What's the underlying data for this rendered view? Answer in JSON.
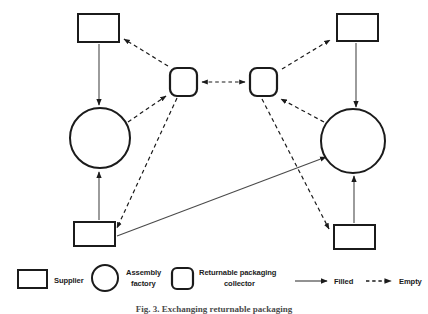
{
  "figure": {
    "caption": "Fig. 3.  Exchanging returnable packaging",
    "caption_visible_fragment": "Fig. 3.  Exchanging returnable packaging"
  },
  "colors": {
    "stroke": "#1b1b1b",
    "fill": "#ffffff",
    "background": "#ffffff",
    "caption": "#4a4a4a"
  },
  "diagram": {
    "nodes": [
      {
        "id": "supplier-top-left",
        "type": "supplier",
        "shape": "rectangle",
        "x": 78,
        "y": 14,
        "w": 41,
        "h": 28
      },
      {
        "id": "factory-left",
        "type": "assembly-factory",
        "shape": "circle",
        "cx": 100,
        "cy": 138,
        "r": 30
      },
      {
        "id": "supplier-bottom-left",
        "type": "supplier",
        "shape": "rectangle",
        "x": 74,
        "y": 222,
        "w": 41,
        "h": 24
      },
      {
        "id": "collector-left",
        "type": "returnable-packaging-collector",
        "shape": "rounded-square",
        "x": 170,
        "y": 68,
        "w": 27,
        "h": 28
      },
      {
        "id": "collector-right",
        "type": "returnable-packaging-collector",
        "shape": "rounded-square",
        "x": 250,
        "y": 68,
        "w": 27,
        "h": 28
      },
      {
        "id": "supplier-top-right",
        "type": "supplier",
        "shape": "rectangle",
        "x": 337,
        "y": 14,
        "w": 41,
        "h": 27
      },
      {
        "id": "factory-right",
        "type": "assembly-factory",
        "shape": "circle",
        "cx": 353,
        "cy": 141,
        "r": 32
      },
      {
        "id": "supplier-bottom-right",
        "type": "supplier",
        "shape": "rectangle",
        "x": 334,
        "y": 225,
        "w": 41,
        "h": 24
      }
    ],
    "edges": [
      {
        "id": "edge-supplier-tl-to-factory-l",
        "from": "supplier-top-left",
        "to": "factory-left",
        "style": "filled"
      },
      {
        "id": "edge-supplier-bl-to-factory-l",
        "from": "supplier-bottom-left",
        "to": "factory-left",
        "style": "filled"
      },
      {
        "id": "edge-supplier-bl-to-factory-r",
        "from": "supplier-bottom-left",
        "to": "factory-right",
        "style": "filled"
      },
      {
        "id": "edge-supplier-tr-to-factory-r",
        "from": "supplier-top-right",
        "to": "factory-right",
        "style": "filled"
      },
      {
        "id": "edge-supplier-br-to-factory-r",
        "from": "supplier-bottom-right",
        "to": "factory-right",
        "style": "filled"
      },
      {
        "id": "edge-collector-l-to-supplier-tl",
        "from": "collector-left",
        "to": "supplier-top-left",
        "style": "empty"
      },
      {
        "id": "edge-factory-l-to-collector-l",
        "from": "factory-left",
        "to": "collector-left",
        "style": "empty"
      },
      {
        "id": "edge-collector-l-to-supplier-bl",
        "from": "collector-left",
        "to": "supplier-bottom-left",
        "style": "empty"
      },
      {
        "id": "edge-collector-l-to-collector-r",
        "from": "collector-left",
        "to": "collector-right",
        "style": "empty-bidirectional"
      },
      {
        "id": "edge-collector-r-to-supplier-tr",
        "from": "collector-right",
        "to": "supplier-top-right",
        "style": "empty"
      },
      {
        "id": "edge-factory-r-to-collector-r",
        "from": "factory-right",
        "to": "collector-right",
        "style": "empty"
      },
      {
        "id": "edge-collector-r-to-supplier-br",
        "from": "collector-right",
        "to": "supplier-bottom-right",
        "style": "empty"
      }
    ]
  },
  "legend": {
    "items": [
      {
        "id": "legend-supplier",
        "glyph": "rectangle-glyph",
        "label_line1": "Supplier",
        "label_line2": ""
      },
      {
        "id": "legend-factory",
        "glyph": "circle-glyph",
        "label_line1": "Assembly",
        "label_line2": "factory"
      },
      {
        "id": "legend-collector",
        "glyph": "rounded-square-glyph",
        "label_line1": "Returnable packaging",
        "label_line2": "collector"
      },
      {
        "id": "legend-filled",
        "glyph": "solid-arrow-glyph",
        "label_line1": "Filled",
        "label_line2": ""
      },
      {
        "id": "legend-empty",
        "glyph": "dashed-arrow-glyph",
        "label_line1": "Empty",
        "label_line2": ""
      }
    ]
  }
}
